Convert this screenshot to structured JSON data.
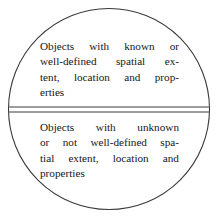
{
  "diagram": {
    "type": "split-circle",
    "shape_name": "circle",
    "stroke_color": "#3a3a3e",
    "fill_color": "#ffffff",
    "background_color": "#ffffff",
    "text_color": "#16161a",
    "geometry": {
      "center_x": 109,
      "center_y": 109,
      "radius": 101,
      "divider_upper_y": 107,
      "divider_lower_y": 112
    },
    "upper_half": {
      "label": "Objects with known or well-defined spatial extent, location and properties",
      "lines": [
        "Objects with known or",
        "well-defined spatial ex-",
        "tent, location and prop-",
        "erties"
      ],
      "line_words": [
        [
          "Objects",
          "with",
          "known",
          "or"
        ],
        [
          "well-defined",
          "spatial",
          "ex-"
        ],
        [
          "tent,",
          "location",
          "and",
          "prop-"
        ],
        [
          "erties"
        ]
      ]
    },
    "lower_half": {
      "label": "Objects with unknown or not well-defined spatial extent, location and properties",
      "lines": [
        "Objects with unknown",
        "or not well-defined spa-",
        "tial extent, location and",
        "properties"
      ],
      "line_words": [
        [
          "Objects",
          "with",
          "unknown"
        ],
        [
          "or",
          "not",
          "well-defined",
          "spa-"
        ],
        [
          "tial",
          "extent,",
          "location",
          "and"
        ],
        [
          "properties"
        ]
      ]
    }
  }
}
